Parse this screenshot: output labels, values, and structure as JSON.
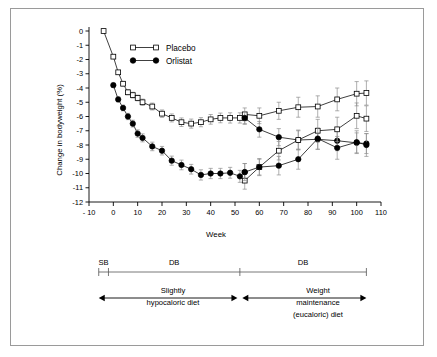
{
  "figure": {
    "background": "#ffffff",
    "frame_color": "#9a9a9a"
  },
  "chart_data": {
    "type": "line",
    "title": "",
    "xlabel": "Week",
    "ylabel": "Change in bodyweight (%)",
    "xlim": [
      -10,
      110
    ],
    "ylim": [
      -12,
      0
    ],
    "xticks": [
      -10,
      0,
      10,
      20,
      30,
      40,
      50,
      60,
      70,
      80,
      90,
      100,
      110
    ],
    "xticklabels": [
      "- 10",
      "0",
      "10",
      "20",
      "30",
      "40",
      "50",
      "60",
      "70",
      "80",
      "90",
      "100",
      "110"
    ],
    "yticks": [
      0,
      -1,
      -2,
      -3,
      -4,
      -5,
      -6,
      -7,
      -8,
      -9,
      -10,
      -11,
      -12
    ],
    "yticklabels": [
      "0",
      "-1",
      "-2",
      "-3",
      "-4",
      "-5",
      "-6",
      "-7",
      "-8",
      "-9",
      "-10",
      "-11",
      "-12"
    ],
    "grid": false,
    "legend_position": "upper-left-inset",
    "errorbars": "SEM",
    "legend": [
      {
        "label": "Placebo",
        "marker": "open-square",
        "color": "#000000"
      },
      {
        "label": "Orlistat",
        "marker": "filled-circle",
        "color": "#000000"
      }
    ],
    "series": [
      {
        "name": "Placebo (year 1)",
        "marker": "open-square",
        "phase": 1,
        "x": [
          -4,
          0,
          2,
          4,
          6,
          8,
          10,
          12,
          16,
          20,
          24,
          28,
          32,
          36,
          40,
          44,
          48,
          52,
          54
        ],
        "y": [
          0.0,
          -1.8,
          -2.9,
          -3.7,
          -4.3,
          -4.5,
          -4.7,
          -5.0,
          -5.3,
          -5.8,
          -6.1,
          -6.4,
          -6.5,
          -6.4,
          -6.2,
          -6.1,
          -6.1,
          -6.1,
          -6.1
        ],
        "err": [
          0.0,
          0.12,
          0.14,
          0.16,
          0.18,
          0.2,
          0.2,
          0.22,
          0.24,
          0.26,
          0.28,
          0.3,
          0.32,
          0.32,
          0.34,
          0.34,
          0.36,
          0.36,
          0.4
        ]
      },
      {
        "name": "Orlistat (year 1)",
        "marker": "filled-circle",
        "phase": 1,
        "x": [
          0,
          2,
          4,
          6,
          8,
          10,
          12,
          16,
          20,
          24,
          28,
          32,
          36,
          40,
          44,
          48,
          52,
          54
        ],
        "y": [
          -3.8,
          -4.8,
          -5.4,
          -6.0,
          -6.5,
          -7.2,
          -7.5,
          -8.1,
          -8.4,
          -9.1,
          -9.4,
          -9.7,
          -10.1,
          -10.0,
          -10.0,
          -9.95,
          -10.2,
          -9.9
        ],
        "err": [
          0.15,
          0.18,
          0.2,
          0.22,
          0.24,
          0.26,
          0.28,
          0.3,
          0.3,
          0.32,
          0.34,
          0.34,
          0.36,
          0.36,
          0.36,
          0.38,
          0.42,
          0.6
        ]
      },
      {
        "name": "Placebo / Placebo (year 2)",
        "marker": "open-square",
        "phase": 2,
        "x": [
          54,
          60,
          68,
          76,
          84,
          92,
          100,
          104
        ],
        "y": [
          -5.85,
          -5.95,
          -5.6,
          -5.35,
          -5.3,
          -4.8,
          -4.4,
          -4.35
        ],
        "err": [
          0.45,
          0.55,
          0.6,
          0.7,
          0.75,
          0.8,
          0.85,
          0.85
        ]
      },
      {
        "name": "Orlistat / Placebo (year 2)",
        "marker": "filled-circle",
        "phase": 2,
        "x": [
          54,
          60,
          68,
          76,
          84,
          92,
          100,
          104
        ],
        "y": [
          -6.1,
          -6.9,
          -7.45,
          -7.65,
          -7.6,
          -7.7,
          -7.85,
          -7.9
        ],
        "err": [
          0.45,
          0.55,
          0.6,
          0.65,
          0.7,
          0.7,
          0.7,
          0.7
        ]
      },
      {
        "name": "Placebo / Orlistat (year 2)",
        "marker": "open-square",
        "phase": 2,
        "x": [
          54,
          60,
          68,
          76,
          84,
          92,
          100,
          104
        ],
        "y": [
          -10.5,
          -9.55,
          -8.4,
          -7.65,
          -7.0,
          -6.9,
          -5.95,
          -6.15
        ],
        "err": [
          0.6,
          0.6,
          0.65,
          0.7,
          0.8,
          0.85,
          0.9,
          0.9
        ]
      },
      {
        "name": "Orlistat / Orlistat (year 2)",
        "marker": "filled-circle",
        "phase": 2,
        "x": [
          54,
          60,
          68,
          76,
          84,
          92,
          100,
          104
        ],
        "y": [
          -9.9,
          -9.55,
          -9.45,
          -9.0,
          -7.55,
          -8.2,
          -7.8,
          -8.0
        ],
        "err": [
          0.6,
          0.55,
          0.65,
          0.7,
          0.75,
          0.8,
          0.8,
          0.8
        ]
      }
    ]
  },
  "phase_bar": {
    "segments": [
      {
        "label": "SB",
        "start": -6,
        "end": -2
      },
      {
        "label": "DB",
        "start": -2,
        "end": 52
      },
      {
        "label": "DB",
        "start": 52,
        "end": 104
      }
    ]
  },
  "diet_bar": {
    "left": {
      "line1": "Slightly",
      "line2": "hypocaloric diet",
      "start": -6,
      "end": 51
    },
    "right": {
      "line1": "Weight",
      "line2": "maintenance",
      "line3": "(eucaloric) diet",
      "start": 53,
      "end": 104
    }
  }
}
